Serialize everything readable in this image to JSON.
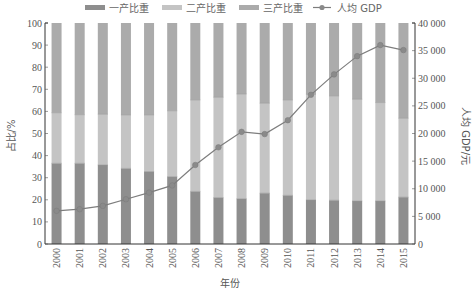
{
  "chart_data": {
    "type": "bar",
    "subtype": "stacked-bar-with-line-secondary-axis",
    "title": "",
    "xlabel": "年份",
    "ylabel": "占比/%",
    "y2label": "人均 GDP/元",
    "categories": [
      "2000",
      "2001",
      "2002",
      "2003",
      "2004",
      "2005",
      "2006",
      "2007",
      "2008",
      "2009",
      "2010",
      "2011",
      "2012",
      "2013",
      "2014",
      "2015"
    ],
    "ylim": [
      0,
      100
    ],
    "y2lim": [
      0,
      40000
    ],
    "yticks": [
      "0",
      "10",
      "20",
      "30",
      "40",
      "50",
      "60",
      "70",
      "80",
      "90",
      "100"
    ],
    "y2ticks": [
      "0",
      "5 000",
      "10 000",
      "15 000",
      "20 000",
      "25 000",
      "30 000",
      "35 000",
      "40 000"
    ],
    "grid": false,
    "legend_position": "top",
    "series": [
      {
        "name": "一产比重",
        "type": "bar",
        "axis": "left",
        "color": "#8e8e8e",
        "values": [
          36.5,
          36.5,
          35.8,
          34.2,
          32.8,
          30.5,
          23.8,
          21.0,
          20.5,
          23.0,
          22.0,
          20.0,
          19.8,
          19.5,
          19.5,
          21.2
        ]
      },
      {
        "name": "二产比重",
        "type": "bar",
        "axis": "left",
        "color": "#c4c4c4",
        "values": [
          22.9,
          22.0,
          22.9,
          24.2,
          25.6,
          29.8,
          41.4,
          45.4,
          47.4,
          40.7,
          43.2,
          47.7,
          47.2,
          46.0,
          44.5,
          35.7
        ]
      },
      {
        "name": "三产比重",
        "type": "bar",
        "axis": "left",
        "color": "#ababab",
        "values": [
          40.6,
          41.5,
          41.3,
          41.6,
          41.6,
          39.7,
          34.8,
          33.6,
          32.1,
          36.3,
          34.8,
          32.3,
          33.0,
          34.5,
          36.0,
          43.1
        ]
      },
      {
        "name": "人均 GDP",
        "type": "line",
        "axis": "right",
        "color": "#7d7d7d",
        "values": [
          6000,
          6300,
          6900,
          8100,
          9300,
          10600,
          14300,
          17500,
          20300,
          19900,
          22400,
          27000,
          30700,
          34000,
          36000,
          35100
        ]
      }
    ]
  },
  "legend": {
    "items": [
      {
        "label": "一产比重",
        "kind": "bar",
        "color": "#8e8e8e"
      },
      {
        "label": "二产比重",
        "kind": "bar",
        "color": "#c4c4c4"
      },
      {
        "label": "三产比重",
        "kind": "bar",
        "color": "#ababab"
      },
      {
        "label": "人均 GDP",
        "kind": "line-marker",
        "color": "#7d7d7d"
      }
    ]
  }
}
